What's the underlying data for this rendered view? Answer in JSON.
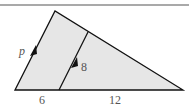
{
  "diagram": {
    "colors": {
      "fill": "#e6e6e6",
      "stroke": "#111111",
      "rule": "#555555",
      "label": "#555555"
    },
    "labels": {
      "side_left": "p",
      "inner_segment": "8",
      "base_left": "6",
      "base_right": "12"
    }
  }
}
